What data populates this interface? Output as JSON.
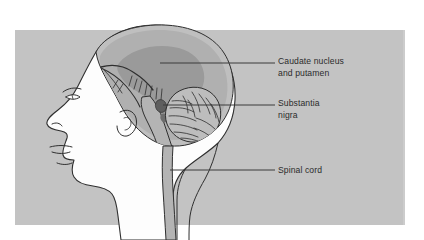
{
  "figure": {
    "kind": "anatomical-illustration",
    "panel": {
      "background_color": "#c3c3c3",
      "page_color": "#ffffff",
      "x": 15,
      "y": 30,
      "width": 390,
      "height": 195
    },
    "colors": {
      "panel_gray": "#c3c3c3",
      "brain_gray": "#b0b0b0",
      "caudate_gray": "#9a9a9a",
      "substantia_nigra": "#5e5e5e",
      "skull_white": "#fdfdfd",
      "outline": "#2f2f2f",
      "leader_line": "#3a3a3a",
      "text": "#2b2b2b"
    }
  },
  "labels": [
    {
      "id": "caudate-putamen",
      "lines": [
        "Caudate nucleus",
        "and putamen"
      ],
      "line1": "Caudate nucleus",
      "line2": "and putamen",
      "text_x": 278,
      "text_y": 64,
      "leader": {
        "x1": 160,
        "y1": 63,
        "x2": 275,
        "y2": 63
      }
    },
    {
      "id": "substantia-nigra",
      "lines": [
        "Substantia",
        "nigra"
      ],
      "line1": "Substantia",
      "line2": "nigra",
      "text_x": 278,
      "text_y": 106,
      "leader": {
        "x1": 163,
        "y1": 105,
        "x2": 275,
        "y2": 105
      }
    },
    {
      "id": "spinal-cord",
      "lines": [
        "Spinal cord"
      ],
      "line1": "Spinal cord",
      "line2": "",
      "text_x": 278,
      "text_y": 173,
      "leader": {
        "x1": 170,
        "y1": 170,
        "x2": 275,
        "y2": 170
      }
    }
  ],
  "structures": [
    {
      "id": "head-profile",
      "name": "Head profile outline"
    },
    {
      "id": "skull",
      "name": "Skull and scalp band"
    },
    {
      "id": "cerebrum",
      "name": "Cerebrum"
    },
    {
      "id": "caudate-putamen",
      "name": "Caudate nucleus and putamen"
    },
    {
      "id": "corpus-callosum",
      "name": "Corpus callosum region"
    },
    {
      "id": "brainstem",
      "name": "Brainstem"
    },
    {
      "id": "substantia-nigra",
      "name": "Substantia nigra"
    },
    {
      "id": "cerebellum",
      "name": "Cerebellum"
    },
    {
      "id": "spinal-cord",
      "name": "Spinal cord"
    }
  ]
}
